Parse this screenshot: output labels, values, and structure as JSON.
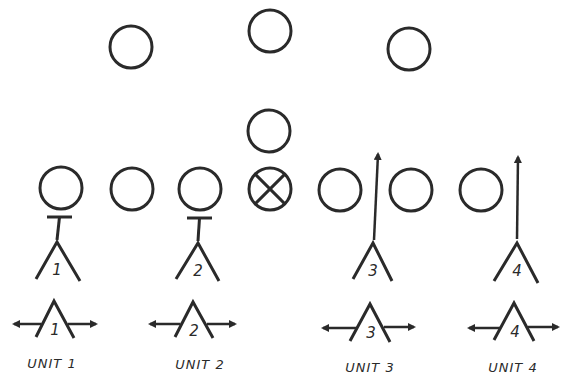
{
  "diagram": {
    "stroke_color": "#2a2a2a",
    "background": "#ffffff",
    "defenders": [
      {
        "id": "d1",
        "cx": 131,
        "cy": 47,
        "r": 21,
        "marked": false
      },
      {
        "id": "d2",
        "cx": 270,
        "cy": 31,
        "r": 21,
        "marked": false
      },
      {
        "id": "d3",
        "cx": 409,
        "cy": 49,
        "r": 21,
        "marked": false
      },
      {
        "id": "d4",
        "cx": 269,
        "cy": 131,
        "r": 21,
        "marked": false
      }
    ],
    "line": [
      {
        "id": "l1",
        "cx": 61,
        "cy": 188,
        "r": 21,
        "marked": false
      },
      {
        "id": "l2",
        "cx": 132,
        "cy": 189,
        "r": 21,
        "marked": false
      },
      {
        "id": "l3",
        "cx": 200,
        "cy": 189,
        "r": 21,
        "marked": false
      },
      {
        "id": "center",
        "cx": 270,
        "cy": 189,
        "r": 21,
        "marked": true
      },
      {
        "id": "l5",
        "cx": 340,
        "cy": 190,
        "r": 21,
        "marked": false
      },
      {
        "id": "l6",
        "cx": 411,
        "cy": 190,
        "r": 21,
        "marked": false
      },
      {
        "id": "l7",
        "cx": 481,
        "cy": 190,
        "r": 21,
        "marked": false
      }
    ],
    "blockers": [
      {
        "number": "1",
        "apex": [
          57,
          242
        ],
        "left": [
          36,
          279
        ],
        "right": [
          80,
          281
        ],
        "action": "block",
        "block_bar": {
          "x1": 47,
          "x2": 72,
          "y": 217
        }
      },
      {
        "number": "2",
        "apex": [
          198,
          243
        ],
        "left": [
          176,
          279
        ],
        "right": [
          219,
          281
        ],
        "action": "block",
        "block_bar": {
          "x1": 187,
          "x2": 212,
          "y": 218
        }
      },
      {
        "number": "3",
        "apex": [
          373,
          243
        ],
        "left": [
          353,
          279
        ],
        "right": [
          392,
          281
        ],
        "action": "route",
        "route": {
          "from": [
            374,
            240
          ],
          "to": [
            378,
            150
          ]
        }
      },
      {
        "number": "4",
        "apex": [
          517,
          243
        ],
        "left": [
          494,
          281
        ],
        "right": [
          538,
          283
        ],
        "action": "route",
        "route": {
          "from": [
            517,
            239
          ],
          "to": [
            518,
            153
          ]
        }
      }
    ],
    "units": [
      {
        "number": "1",
        "label": "UNIT 1",
        "apex": [
          54,
          301
        ],
        "left": [
          36,
          337
        ],
        "right": [
          74,
          338
        ],
        "arrow_left_tip": [
          10,
          324
        ],
        "arrow_right_tip": [
          100,
          324
        ],
        "label_x": 52,
        "label_y": 368
      },
      {
        "number": "2",
        "label": "UNIT 2",
        "apex": [
          193,
          302
        ],
        "left": [
          175,
          337
        ],
        "right": [
          213,
          338
        ],
        "arrow_left_tip": [
          146,
          324
        ],
        "arrow_right_tip": [
          239,
          324
        ],
        "label_x": 200,
        "label_y": 369
      },
      {
        "number": "3",
        "label": "UNIT 3",
        "apex": [
          370,
          304
        ],
        "left": [
          350,
          341
        ],
        "right": [
          390,
          342
        ],
        "arrow_left_tip": [
          319,
          328
        ],
        "arrow_right_tip": [
          418,
          327
        ],
        "label_x": 370,
        "label_y": 372
      },
      {
        "number": "4",
        "label": "UNIT 4",
        "apex": [
          514,
          303
        ],
        "left": [
          494,
          340
        ],
        "right": [
          534,
          341
        ],
        "arrow_left_tip": [
          465,
          328
        ],
        "arrow_right_tip": [
          562,
          327
        ],
        "label_x": 513,
        "label_y": 372
      }
    ]
  }
}
